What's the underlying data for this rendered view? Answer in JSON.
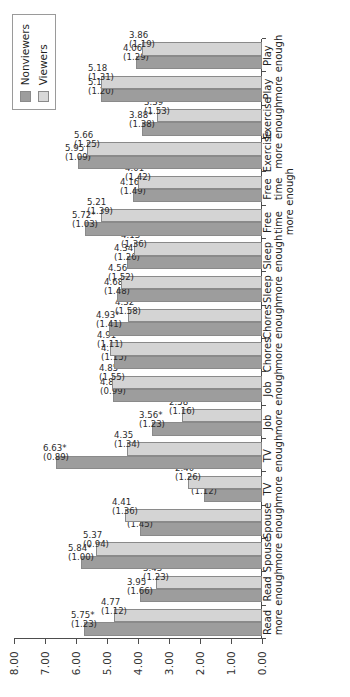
{
  "chart_data": {
    "type": "bar",
    "title": "",
    "subtitle": "",
    "xlabel": "",
    "ylabel": "",
    "ylim": [
      0.0,
      8.0
    ],
    "yticks": [
      "0.00",
      "1.00",
      "2.00",
      "3.00",
      "4.00",
      "5.00",
      "6.00",
      "7.00",
      "8.00"
    ],
    "grid": false,
    "orientation": "vertical-bars-rotated-90",
    "legend_position": "top-right",
    "categories": [
      "Read\nmore",
      "Read\nenough",
      "Spouse\nmore",
      "Spouse\nenough",
      "TV more",
      "TV\nenough",
      "Job\nmore",
      "Job\nenough",
      "Chores\nmore",
      "Chores\nenough",
      "Sleep\nmore",
      "Sleep\nenough",
      "Free\ntime\nmore",
      "Free\ntime\nenough",
      "Exercise\nmore",
      "Exercise\nenough",
      "Play\nmore",
      "Play\nenough"
    ],
    "series": [
      {
        "name": "Nonviewers",
        "color": "#9d9d9d",
        "values": [
          5.75,
          3.95,
          5.84,
          3.95,
          1.88,
          6.63,
          3.56,
          4.8,
          4.76,
          4.93,
          4.68,
          4.34,
          5.72,
          4.16,
          5.95,
          3.88,
          5.18,
          4.06
        ],
        "labels": [
          "5.75*",
          "3.95",
          "5.84*",
          "3.95",
          "1.88",
          "6.63*",
          "3.56*",
          "4.80",
          "4.76",
          "4.93*",
          "4.68",
          "4.34",
          "5.72*",
          "4.16",
          "5.95",
          "3.88*",
          "5.18",
          "4.06"
        ],
        "sd": [
          "(1.23)",
          "(1.66)",
          "(1.00)",
          "(1.45)",
          "(1.12)",
          "(0.89)",
          "(1.23)",
          "(0.99)",
          "(1.15)",
          "(1.41)",
          "(1.48)",
          "(1.26)",
          "(1.03)",
          "(1.49)",
          "(1.09)",
          "(1.38)",
          "(1.20)",
          "(1.29)"
        ]
      },
      {
        "name": "Viewers",
        "color": "#d4d4d4",
        "values": [
          4.77,
          3.43,
          5.37,
          4.41,
          2.4,
          4.35,
          2.58,
          4.85,
          4.91,
          4.32,
          4.56,
          4.13,
          5.21,
          4.01,
          5.66,
          3.39,
          5.18,
          3.86
        ],
        "labels": [
          "4.77",
          "3.43",
          "5.37",
          "4.41",
          "2.40*",
          "4.35",
          "2.58",
          "4.85",
          "4.91",
          "4.32",
          "4.56",
          "4.13",
          "5.21",
          "4.01",
          "5.66",
          "3.39",
          "5.18",
          "3.86"
        ],
        "sd": [
          "(1.12)",
          "(1.23)",
          "(0.94)",
          "(1.36)",
          "(1.26)",
          "(1.34)",
          "(1.16)",
          "(1.55)",
          "(1.11)",
          "(1.58)",
          "(1.52)",
          "(1.36)",
          "(1.39)",
          "(1.42)",
          "(1.25)",
          "(1.53)",
          "(1.31)",
          "(1.19)"
        ]
      }
    ],
    "legend": [
      {
        "label": "Nonviewers",
        "color": "#9d9d9d"
      },
      {
        "label": "Viewers",
        "color": "#d8d8d8"
      }
    ]
  }
}
